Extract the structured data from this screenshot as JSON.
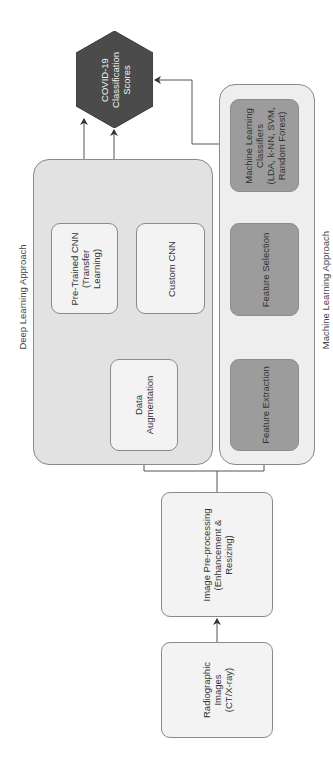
{
  "diagram": {
    "groups": {
      "deep_learning": {
        "label": "Deep Learning Approach"
      },
      "machine_learning": {
        "label": "Machine Learning Approach"
      }
    },
    "nodes": {
      "radiographic": {
        "lines": [
          "Radiographic",
          "Images",
          "(CT/X-ray)"
        ]
      },
      "preprocessing": {
        "lines": [
          "Image Pre-processing",
          "(Enhancement &",
          "Resizing)"
        ]
      },
      "data_augmentation": {
        "lines": [
          "Data",
          "Augmentation"
        ]
      },
      "pretrained_cnn": {
        "lines": [
          "Pre-Trained CNN",
          "(Transfer",
          "Learning)"
        ]
      },
      "custom_cnn": {
        "lines": [
          "Custom CNN"
        ]
      },
      "feature_extraction": {
        "lines": [
          "Feature Extraction"
        ]
      },
      "feature_selection": {
        "lines": [
          "Feature Selection"
        ]
      },
      "ml_classifiers": {
        "lines": [
          "Machine Learning",
          "Classifiers",
          "(LDA, k-NN, SVM,",
          "Random Forest)"
        ]
      },
      "output": {
        "lines": [
          "COVID-19",
          "Classification",
          "Scores"
        ]
      }
    },
    "edges": [
      {
        "from": "Radiographic Images",
        "to": "Image Pre-processing"
      },
      {
        "from": "Image Pre-processing",
        "to": "Data Augmentation"
      },
      {
        "from": "Image Pre-processing",
        "to": "Feature Extraction"
      },
      {
        "from": "Data Augmentation",
        "to": "Pre-Trained CNN"
      },
      {
        "from": "Data Augmentation",
        "to": "Custom CNN"
      },
      {
        "from": "Pre-Trained CNN",
        "to": "COVID-19 Classification Scores"
      },
      {
        "from": "Custom CNN",
        "to": "COVID-19 Classification Scores"
      },
      {
        "from": "Feature Extraction",
        "to": "Feature Selection"
      },
      {
        "from": "Feature Selection",
        "to": "Machine Learning Classifiers"
      },
      {
        "from": "Machine Learning Classifiers",
        "to": "COVID-19 Classification Scores"
      }
    ],
    "colors": {
      "output_fill": "#4b4b4b",
      "feature_fill": "#9c9c9c",
      "dl_group_fill": "#e2e2e2",
      "ml_group_fill": "#eeeeee",
      "light_node_fill": "#f3f3f3",
      "line": "#555555"
    }
  }
}
